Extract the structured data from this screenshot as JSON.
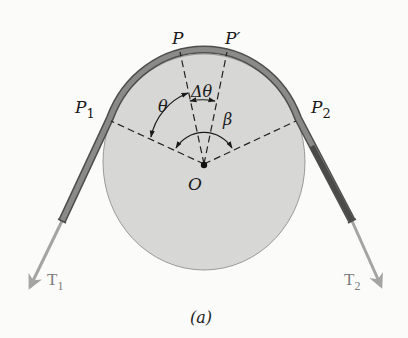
{
  "figure": {
    "caption": "(a)"
  },
  "labels": {
    "P": "P",
    "P_prime": "P′",
    "P1_main": "P",
    "P1_sub": "1",
    "P2_main": "P",
    "P2_sub": "2",
    "delta_theta": "Δθ",
    "theta": "θ",
    "beta": "β",
    "center": "O",
    "T1_main": "T",
    "T1_sub": "1",
    "T2_main": "T",
    "T2_sub": "2"
  },
  "colors": {
    "background": "#fbfbfa",
    "drum_fill": "#d7d7d5",
    "drum_stroke": "#9a9a98",
    "belt_fill": "#8a8a88",
    "belt_stroke": "#4e4e4c",
    "belt_end_right": "#4a4a48",
    "tension_arrow": "#a4a4a2",
    "dash_line": "#222222",
    "text": "#1a1a1a",
    "tension_text": "#7a7a7a"
  }
}
